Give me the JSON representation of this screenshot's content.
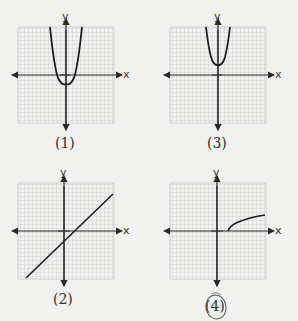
{
  "panels": [
    {
      "label": "(1)",
      "x_axis": "x",
      "y_axis": "y",
      "curve": "parabola opening up, vertex below origin"
    },
    {
      "label": "(2)",
      "x_axis": "x",
      "y_axis": "y",
      "curve": "line with positive slope, negative y-intercept"
    },
    {
      "label": "(3)",
      "x_axis": "x",
      "y_axis": "y",
      "curve": "parabola opening up, vertex above origin"
    },
    {
      "label": "(4)",
      "x_axis": "x",
      "y_axis": "y",
      "curve": "square-root curve starting on positive x-axis",
      "circled": true
    }
  ],
  "colors": {
    "grid": "#b8b8b8",
    "axis": "#2a2a2a",
    "curve": "#1e1e1e",
    "background": "#f1f1ef"
  }
}
